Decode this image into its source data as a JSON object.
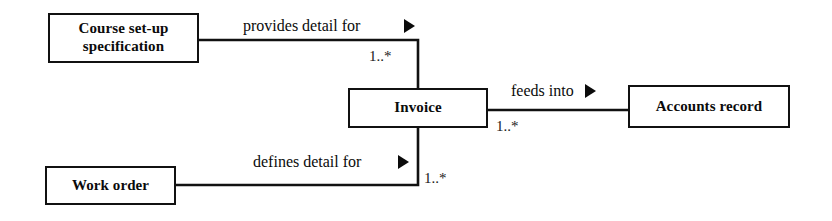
{
  "diagram": {
    "type": "entity-relationship-diagram",
    "title": "",
    "background_color": "#ffffff",
    "line_color": "#111111",
    "text_color": "#0b0b0b",
    "entities": [
      {
        "id": "course-setup-specification",
        "label": "Course set-up\nspecification",
        "x": 48,
        "y": 13,
        "width": 151,
        "height": 50,
        "font_size": 15
      },
      {
        "id": "invoice",
        "label": "Invoice",
        "x": 348,
        "y": 88,
        "width": 140,
        "height": 40,
        "font_size": 15
      },
      {
        "id": "accounts-record",
        "label": "Accounts record",
        "x": 628,
        "y": 85,
        "width": 162,
        "height": 43,
        "font_size": 15
      },
      {
        "id": "work-order",
        "label": "Work order",
        "x": 45,
        "y": 166,
        "width": 131,
        "height": 39,
        "font_size": 15
      }
    ],
    "relationships": [
      {
        "id": "provides-detail-for",
        "label": "provides detail for",
        "from": "course-setup-specification",
        "to": "invoice",
        "label_x": 243,
        "label_y": 18,
        "font_size": 16,
        "arrow_x": 404,
        "arrow_y": 19,
        "multiplicity": "1..*",
        "mult_x": 369,
        "mult_y": 49,
        "mult_font_size": 15
      },
      {
        "id": "feeds-into",
        "label": "feeds into",
        "from": "invoice",
        "to": "accounts-record",
        "label_x": 511,
        "label_y": 83,
        "font_size": 16,
        "arrow_x": 585,
        "arrow_y": 84,
        "multiplicity": "1..*",
        "mult_x": 496,
        "mult_y": 119,
        "mult_font_size": 15
      },
      {
        "id": "defines-detail-for",
        "label": "defines detail for",
        "from": "work-order",
        "to": "invoice",
        "label_x": 253,
        "label_y": 154,
        "font_size": 16,
        "arrow_x": 398,
        "arrow_y": 155,
        "multiplicity": "1..*",
        "mult_x": 424,
        "mult_y": 171,
        "mult_font_size": 15
      }
    ]
  }
}
